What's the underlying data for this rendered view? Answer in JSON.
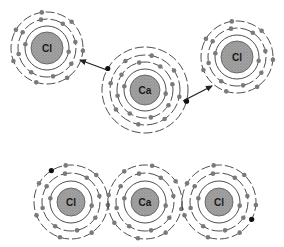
{
  "diagram": {
    "title": "",
    "colors": {
      "nucleus_fill": "#9a9a9a",
      "nucleus_stroke": "#555555",
      "shell_stroke": "#3a3a3a",
      "electron": "#7a7a7a",
      "transferred_electron": "#111111",
      "arrow": "#222222",
      "background": "#ffffff"
    },
    "top_panel": {
      "description": "Before: calcium atom transfers its two outer electrons to two chlorine atoms",
      "atoms": [
        {
          "id": "cl-left-top",
          "symbol": "Cl",
          "cx": 47,
          "cy": 48,
          "nucleus_r": 16,
          "shells": [
            22,
            29,
            36
          ],
          "electrons": [
            2,
            8,
            7
          ],
          "extra": []
        },
        {
          "id": "ca-center-top",
          "symbol": "Ca",
          "cx": 145,
          "cy": 90,
          "nucleus_r": 15,
          "shells": [
            21,
            28,
            35,
            43
          ],
          "electrons": [
            2,
            8,
            8,
            0
          ],
          "extra": [
            {
              "angle": 210,
              "r": 43
            },
            {
              "angle": 15,
              "r": 43
            }
          ]
        },
        {
          "id": "cl-right-top",
          "symbol": "Cl",
          "cx": 237,
          "cy": 57,
          "nucleus_r": 16,
          "shells": [
            22,
            29,
            36
          ],
          "electrons": [
            2,
            8,
            7
          ],
          "extra": []
        }
      ],
      "arrows": [
        {
          "id": "arrow-left",
          "x1": 107,
          "y1": 70,
          "x2": 80,
          "y2": 60
        },
        {
          "id": "arrow-right",
          "x1": 183,
          "y1": 101,
          "x2": 212,
          "y2": 86
        }
      ]
    },
    "bottom_panel": {
      "description": "After: Cl- Ca2+ Cl- ions with transferred electrons shown in black",
      "atoms": [
        {
          "id": "cl-left-bottom",
          "symbol": "Cl",
          "cx": 71,
          "cy": 202,
          "nucleus_r": 14,
          "shells": [
            21,
            29,
            37
          ],
          "electrons": [
            2,
            8,
            7
          ],
          "extra": [
            {
              "angle": 238,
              "r": 37
            }
          ]
        },
        {
          "id": "ca-center-bottom",
          "symbol": "Ca",
          "cx": 145,
          "cy": 202,
          "nucleus_r": 14,
          "shells": [
            21,
            29,
            37
          ],
          "electrons": [
            2,
            8,
            8
          ],
          "extra": []
        },
        {
          "id": "cl-right-bottom",
          "symbol": "Cl",
          "cx": 219,
          "cy": 202,
          "nucleus_r": 14,
          "shells": [
            21,
            29,
            37
          ],
          "electrons": [
            2,
            8,
            7
          ],
          "extra": [
            {
              "angle": 28,
              "r": 37
            }
          ]
        }
      ]
    }
  }
}
